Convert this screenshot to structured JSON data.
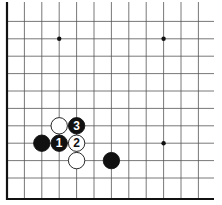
{
  "board": {
    "description": "Go board corner diagram (lower-left corner)",
    "grid_color": "#555555",
    "edge_color": "#111111",
    "star_points": [
      [
        3,
        2
      ],
      [
        9,
        2
      ],
      [
        9,
        8
      ]
    ],
    "stones": [
      {
        "color": "white",
        "col": 3,
        "row": 7,
        "label": ""
      },
      {
        "color": "black",
        "col": 4,
        "row": 7,
        "label": "3"
      },
      {
        "color": "black",
        "col": 2,
        "row": 8,
        "label": ""
      },
      {
        "color": "black",
        "col": 3,
        "row": 8,
        "label": "1"
      },
      {
        "color": "white",
        "col": 4,
        "row": 8,
        "label": "2"
      },
      {
        "color": "white",
        "col": 4,
        "row": 9,
        "label": ""
      },
      {
        "color": "black",
        "col": 6,
        "row": 9,
        "label": ""
      }
    ]
  }
}
